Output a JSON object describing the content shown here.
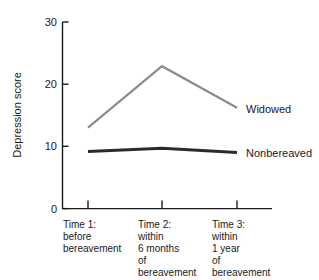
{
  "chart_data": {
    "type": "line",
    "title": "",
    "xlabel": "",
    "ylabel": "Depression score",
    "ylim": [
      0,
      30
    ],
    "yticks": [
      0,
      10,
      20,
      30
    ],
    "ytick_labels": [
      "0",
      "10",
      "20",
      "30"
    ],
    "grid": false,
    "legend_position": "right-of-line-ends",
    "categories": [
      "Time 1",
      "Time 2",
      "Time 3"
    ],
    "category_labels": [
      [
        "Time 1:",
        "before",
        "bereavement"
      ],
      [
        "Time 2:",
        "within",
        "6 months",
        "of",
        "bereavement"
      ],
      [
        "Time 3:",
        "within",
        "1 year",
        "of",
        "bereavement"
      ]
    ],
    "series": [
      {
        "name": "Widowed",
        "color": "#8c8c8c",
        "line_width": 2.2,
        "values": [
          13,
          22.9,
          16.2
        ]
      },
      {
        "name": "Nonbereaved",
        "color": "#2b2b2b",
        "line_width": 3.0,
        "values": [
          9.2,
          9.7,
          9.0
        ]
      }
    ]
  },
  "axis": {
    "color": "#1a1a1a",
    "y_title": "Depression score"
  }
}
